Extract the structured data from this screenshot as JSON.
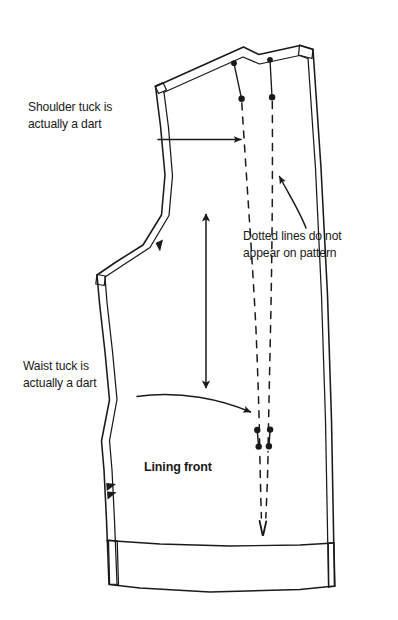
{
  "figure": {
    "background_color": "#ffffff",
    "ink_color": "#1a1a1a",
    "width": 398,
    "height": 620
  },
  "annotations": [
    {
      "id": "shoulder-tuck",
      "text": "Shoulder tuck is\nactually a dart",
      "bold": false,
      "leader": "straight-arrow-right"
    },
    {
      "id": "dotted-lines",
      "text": "Dotted lines do not\nappear on pattern",
      "bold": false,
      "leader": "curved-arrow-up-left"
    },
    {
      "id": "waist-tuck",
      "text": "Waist tuck is\nactually a dart",
      "bold": false,
      "leader": "curved-arrow-right"
    },
    {
      "id": "lining-front",
      "text": "Lining front",
      "bold": true,
      "leader": "none"
    }
  ],
  "pattern": {
    "piece_name": "Lining front",
    "markings": {
      "grainline": "double-headed vertical arrow",
      "armhole_notch_count": 1,
      "side_seam_notch_count": 2,
      "shoulder_tuck_dots": 2,
      "waist_tuck_dots": 4,
      "dotted_dart_legs": 2,
      "hem_band": true,
      "seam_allowance_lines": true
    }
  },
  "footer": {
    "caption": ""
  }
}
